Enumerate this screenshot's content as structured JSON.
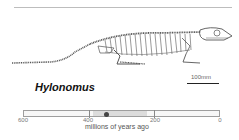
{
  "figure": {
    "title": "Hylonomus",
    "scale_bar_label": "100mm",
    "timeline": {
      "axis_title": "millions of years ago",
      "ticks": [
        "600",
        "400",
        "200",
        "0"
      ],
      "range_start_mya": 390,
      "range_end_mya": 225,
      "marker_mya": 345
    },
    "illustration": "skeleton-illustration"
  }
}
